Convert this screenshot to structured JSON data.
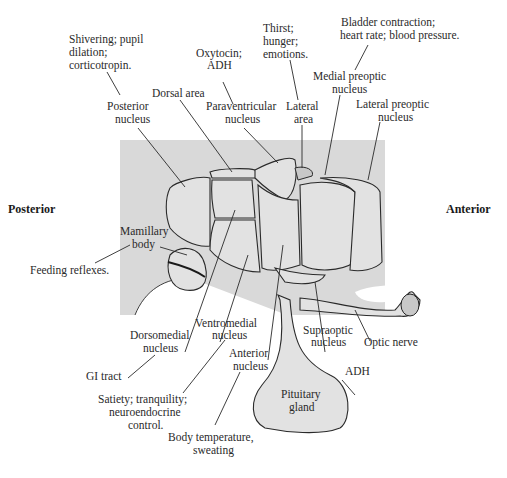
{
  "diagram": {
    "orientation": {
      "posterior": "Posterior",
      "anterior": "Anterior"
    },
    "labels": {
      "posterior_nucleus": [
        "Posterior",
        "nucleus"
      ],
      "posterior_nucleus_function": [
        "Shivering; pupil",
        "dilation;",
        "corticotropin."
      ],
      "dorsal_area": [
        "Dorsal area"
      ],
      "paraventricular_nucleus": [
        "Paraventricular",
        "nucleus"
      ],
      "paraventricular_function": [
        "Oxytocin;",
        "ADH"
      ],
      "lateral_area": [
        "Lateral",
        "area"
      ],
      "lateral_area_function": [
        "Thirst;",
        "hunger;",
        "emotions."
      ],
      "medial_preoptic_nucleus": [
        "Medial preoptic",
        "nucleus"
      ],
      "medial_preoptic_function": [
        "Bladder contraction;",
        "heart rate; blood pressure."
      ],
      "lateral_preoptic_nucleus": [
        "Lateral preoptic",
        "nucleus"
      ],
      "mamillary_body": [
        "Mamillary",
        "body"
      ],
      "mamillary_function": [
        "Feeding reflexes."
      ],
      "dorsomedial_nucleus": [
        "Dorsomedial",
        "nucleus"
      ],
      "dorsomedial_function": [
        "GI tract"
      ],
      "ventromedial_nucleus": [
        "Ventromedial",
        "nucleus"
      ],
      "ventromedial_function": [
        "Satiety; tranquility;",
        "neuroendocrine",
        "control."
      ],
      "anterior_nucleus": [
        "Anterior",
        "nucleus"
      ],
      "anterior_function": [
        "Body temperature,",
        "sweating"
      ],
      "supraoptic_nucleus": [
        "Supraoptic",
        "nucleus"
      ],
      "supraoptic_function": [
        "ADH"
      ],
      "optic_nerve": [
        "Optic nerve"
      ],
      "pituitary_gland": [
        "Pituitary",
        "gland"
      ]
    },
    "colors": {
      "background_panel": "#d9d9d9",
      "structure_fill": "#e2e2e2",
      "outline": "#2a2a2a"
    }
  }
}
